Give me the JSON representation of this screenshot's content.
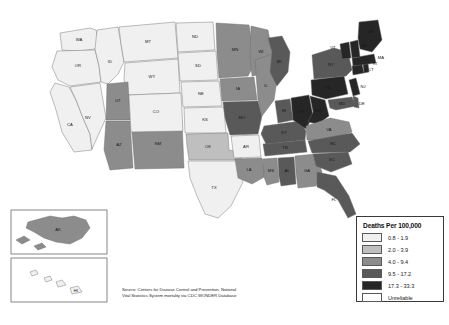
{
  "figure": {
    "kind": "choropleth-map",
    "region": "United States",
    "title": ""
  },
  "legend": {
    "title": "Deaths Per 100,000",
    "entries": [
      {
        "label": "0.8 - 1.9",
        "color": "#f0f0f0"
      },
      {
        "label": "2.0 - 3.9",
        "color": "#bfbfbf"
      },
      {
        "label": "4.0 - 9.4",
        "color": "#8c8c8c"
      },
      {
        "label": "9.5 - 17.2",
        "color": "#595959"
      },
      {
        "label": "17.3 - 33.3",
        "color": "#262626"
      },
      {
        "label": "Unreliable",
        "color": "#ffffff"
      }
    ]
  },
  "source": {
    "line1": "Source: Centers for Disease Control and Prevention, National",
    "line2": "Vital Statistics System mortality via CDC WONDER Database"
  },
  "insets": {
    "alaska_label": "AK",
    "hawaii_label": "HI"
  },
  "chart_data": {
    "type": "heatmap",
    "title": "Deaths Per 100,000",
    "classes": [
      "0.8 - 1.9",
      "2.0 - 3.9",
      "4.0 - 9.4",
      "9.5 - 17.2",
      "17.3 - 33.3",
      "Unreliable"
    ],
    "class_colors": [
      "#f0f0f0",
      "#bfbfbf",
      "#8c8c8c",
      "#595959",
      "#262626",
      "#ffffff"
    ],
    "states": [
      {
        "code": "WA",
        "label": "WA",
        "class": 0
      },
      {
        "code": "OR",
        "label": "OR",
        "class": 0
      },
      {
        "code": "CA",
        "label": "CA",
        "class": 0
      },
      {
        "code": "NV",
        "label": "NV",
        "class": 0
      },
      {
        "code": "ID",
        "label": "ID",
        "class": 0
      },
      {
        "code": "MT",
        "label": "MT",
        "class": 0
      },
      {
        "code": "WY",
        "label": "WY",
        "class": 0
      },
      {
        "code": "UT",
        "label": "UT",
        "class": 2
      },
      {
        "code": "AZ",
        "label": "AZ",
        "class": 2
      },
      {
        "code": "NM",
        "label": "NM",
        "class": 2
      },
      {
        "code": "CO",
        "label": "CO",
        "class": 0
      },
      {
        "code": "ND",
        "label": "ND",
        "class": 0
      },
      {
        "code": "SD",
        "label": "SD",
        "class": 0
      },
      {
        "code": "NE",
        "label": "NE",
        "class": 0
      },
      {
        "code": "KS",
        "label": "KS",
        "class": 0
      },
      {
        "code": "OK",
        "label": "OK",
        "class": 1
      },
      {
        "code": "TX",
        "label": "TX",
        "class": 0
      },
      {
        "code": "MN",
        "label": "MN",
        "class": 2
      },
      {
        "code": "IA",
        "label": "IA",
        "class": 2
      },
      {
        "code": "MO",
        "label": "MO",
        "class": 3
      },
      {
        "code": "AR",
        "label": "AR",
        "class": 0
      },
      {
        "code": "LA",
        "label": "LA",
        "class": 2
      },
      {
        "code": "WI",
        "label": "WI",
        "class": 2
      },
      {
        "code": "IL",
        "label": "IL",
        "class": 2
      },
      {
        "code": "MS",
        "label": "MS",
        "class": 2
      },
      {
        "code": "AL",
        "label": "AL",
        "class": 3
      },
      {
        "code": "GA",
        "label": "GA",
        "class": 2
      },
      {
        "code": "FL",
        "label": "FL",
        "class": 3
      },
      {
        "code": "TN",
        "label": "TN",
        "class": 3
      },
      {
        "code": "KY",
        "label": "KY",
        "class": 3
      },
      {
        "code": "IN",
        "label": "IN",
        "class": 3
      },
      {
        "code": "MI",
        "label": "MI",
        "class": 3
      },
      {
        "code": "OH",
        "label": "OH",
        "class": 4
      },
      {
        "code": "WV",
        "label": "WV",
        "class": 4
      },
      {
        "code": "VA",
        "label": "VA",
        "class": 2
      },
      {
        "code": "NC",
        "label": "NC",
        "class": 3
      },
      {
        "code": "SC",
        "label": "SC",
        "class": 3
      },
      {
        "code": "PA",
        "label": "PA",
        "class": 4
      },
      {
        "code": "NY",
        "label": "NY",
        "class": 3
      },
      {
        "code": "MD",
        "label": "MD",
        "class": 3
      },
      {
        "code": "DE",
        "label": "DE",
        "class": 3
      },
      {
        "code": "NJ",
        "label": "NJ",
        "class": 4
      },
      {
        "code": "CT",
        "label": "CT",
        "class": 4
      },
      {
        "code": "RI",
        "label": "RI",
        "class": 4
      },
      {
        "code": "MA",
        "label": "MA",
        "class": 4
      },
      {
        "code": "VT",
        "label": "VT",
        "class": 4
      },
      {
        "code": "NH",
        "label": "NH",
        "class": 4
      },
      {
        "code": "ME",
        "label": "ME",
        "class": 4
      },
      {
        "code": "AK",
        "label": "AK",
        "class": 2
      },
      {
        "code": "HI",
        "label": "HI",
        "class": 0
      }
    ]
  }
}
